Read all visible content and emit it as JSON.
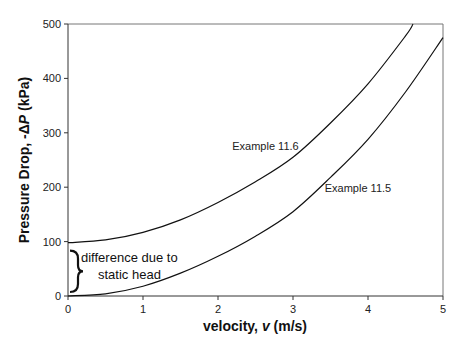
{
  "chart_data": {
    "type": "line",
    "title": "",
    "xlabel": "velocity, v (m/s)",
    "xlabel_parts": {
      "pre": "velocity, ",
      "var": "v",
      "post": " (m/s)"
    },
    "ylabel": "Pressure Drop, -ΔP (kPa)",
    "ylabel_parts": {
      "pre": "Pressure Drop, -Δ",
      "var": "P",
      "post": " (kPa)"
    },
    "xlim": [
      0,
      5
    ],
    "ylim": [
      0,
      500
    ],
    "xticks": [
      "0",
      "1",
      "2",
      "3",
      "4",
      "5"
    ],
    "yticks": [
      "0",
      "100",
      "200",
      "300",
      "400",
      "500"
    ],
    "grid": false,
    "legend": "none (inline labels)",
    "series": [
      {
        "name": "Example 11.6",
        "x": [
          0,
          0.5,
          1,
          1.5,
          2,
          2.5,
          3,
          3.5,
          4,
          4.5,
          4.6
        ],
        "values": [
          98,
          103,
          117,
          140,
          172,
          210,
          255,
          318,
          390,
          478,
          500
        ]
      },
      {
        "name": "Example 11.5",
        "x": [
          0,
          0.5,
          1,
          1.5,
          2,
          2.5,
          3,
          3.5,
          4,
          4.5,
          5
        ],
        "values": [
          0,
          4,
          18,
          42,
          73,
          110,
          155,
          218,
          288,
          375,
          475
        ]
      }
    ],
    "annotations": [
      {
        "text": "Example 11.6",
        "x": 2.75,
        "y": 275
      },
      {
        "text": "Example 11.5",
        "x": 3.85,
        "y": 198
      },
      {
        "text_line1": "difference due to",
        "text_line2": "static head",
        "x": 0.1,
        "y": 50,
        "brace_from": 0,
        "brace_to": 98
      }
    ]
  }
}
